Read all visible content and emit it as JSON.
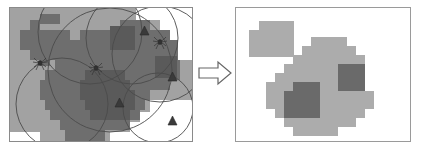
{
  "figure": {
    "title": "",
    "type": "raster-map-transformation-diagram",
    "width": 421,
    "height": 148,
    "background_color": "#ffffff"
  },
  "colors": {
    "panel_background_gray": "#a2a2a2",
    "raster_medium_gray": "#6e6e6e",
    "raster_dark_gray": "#5a5a5a",
    "raster_light_gray": "#a8a8a8",
    "raster_blob_gray": "#acacac",
    "raster_blob_dark_gray": "#6a6a6a",
    "white": "#ffffff",
    "outline_stroke": "#4b4b4b",
    "panel_border": "#8a8a8a",
    "arrow_stroke": "#666666"
  },
  "left_panel": {
    "label": "source-raster-with-overlays",
    "background": "#a2a2a2",
    "border": "#8a8a8a",
    "medium_patches": [
      {
        "x": 20,
        "y": 12,
        "w": 10,
        "h": 10
      },
      {
        "x": 30,
        "y": 6,
        "w": 20,
        "h": 10
      },
      {
        "x": 20,
        "y": 22,
        "w": 40,
        "h": 10
      },
      {
        "x": 10,
        "y": 22,
        "w": 10,
        "h": 20
      },
      {
        "x": 20,
        "y": 32,
        "w": 40,
        "h": 10
      },
      {
        "x": 20,
        "y": 42,
        "w": 30,
        "h": 10
      },
      {
        "x": 30,
        "y": 52,
        "w": 10,
        "h": 6
      },
      {
        "x": 70,
        "y": 22,
        "w": 50,
        "h": 10
      },
      {
        "x": 60,
        "y": 32,
        "w": 70,
        "h": 10
      },
      {
        "x": 50,
        "y": 42,
        "w": 90,
        "h": 10
      },
      {
        "x": 110,
        "y": 12,
        "w": 30,
        "h": 10
      },
      {
        "x": 120,
        "y": 22,
        "w": 40,
        "h": 10
      },
      {
        "x": 130,
        "y": 32,
        "w": 40,
        "h": 10
      },
      {
        "x": 140,
        "y": 42,
        "w": 30,
        "h": 10
      },
      {
        "x": 45,
        "y": 52,
        "w": 125,
        "h": 10
      },
      {
        "x": 35,
        "y": 62,
        "w": 135,
        "h": 10
      },
      {
        "x": 30,
        "y": 72,
        "w": 130,
        "h": 10
      },
      {
        "x": 30,
        "y": 82,
        "w": 110,
        "h": 10
      },
      {
        "x": 35,
        "y": 92,
        "w": 100,
        "h": 10
      },
      {
        "x": 40,
        "y": 102,
        "w": 90,
        "h": 10
      },
      {
        "x": 50,
        "y": 112,
        "w": 70,
        "h": 10
      },
      {
        "x": 55,
        "y": 122,
        "w": 40,
        "h": 11
      }
    ],
    "dark_patches": [
      {
        "x": 75,
        "y": 62,
        "w": 40,
        "h": 10
      },
      {
        "x": 70,
        "y": 72,
        "w": 50,
        "h": 10
      },
      {
        "x": 70,
        "y": 82,
        "w": 55,
        "h": 10
      },
      {
        "x": 75,
        "y": 92,
        "w": 50,
        "h": 10
      },
      {
        "x": 80,
        "y": 102,
        "w": 40,
        "h": 10
      },
      {
        "x": 100,
        "y": 18,
        "w": 25,
        "h": 24
      },
      {
        "x": 145,
        "y": 48,
        "w": 22,
        "h": 22
      }
    ],
    "white_patches": [
      {
        "x": 126,
        "y": 0,
        "w": 40,
        "h": 12
      },
      {
        "x": 150,
        "y": 0,
        "w": 34,
        "h": 22
      },
      {
        "x": 160,
        "y": 12,
        "w": 24,
        "h": 20
      },
      {
        "x": 168,
        "y": 22,
        "w": 16,
        "h": 30
      },
      {
        "x": 140,
        "y": 92,
        "w": 44,
        "h": 12
      },
      {
        "x": 130,
        "y": 104,
        "w": 54,
        "h": 10
      },
      {
        "x": 120,
        "y": 114,
        "w": 64,
        "h": 10
      },
      {
        "x": 100,
        "y": 124,
        "w": 84,
        "h": 11
      },
      {
        "x": 0,
        "y": 124,
        "w": 30,
        "h": 11
      }
    ],
    "circles": [
      {
        "cx": 100,
        "cy": 62,
        "r": 62,
        "label": "buffer-circle-large-center"
      },
      {
        "cx": 80,
        "cy": 24,
        "r": 52,
        "label": "buffer-circle-upper-left"
      },
      {
        "cx": 122,
        "cy": 30,
        "r": 46,
        "label": "buffer-circle-upper-right"
      },
      {
        "cx": 150,
        "cy": 46,
        "r": 48,
        "label": "buffer-circle-right"
      },
      {
        "cx": 148,
        "cy": 100,
        "r": 35,
        "label": "buffer-circle-lower-right"
      },
      {
        "cx": 52,
        "cy": 96,
        "r": 46,
        "label": "buffer-circle-lower-left"
      }
    ],
    "spider_markers": [
      {
        "x": 30,
        "y": 55,
        "label": "spider-symbol-left"
      },
      {
        "x": 86,
        "y": 60,
        "label": "spider-symbol-center"
      },
      {
        "x": 150,
        "y": 34,
        "label": "spider-symbol-right"
      }
    ],
    "triangle_markers": [
      {
        "x": 130,
        "y": 22,
        "label": "triangle-marker-top"
      },
      {
        "x": 158,
        "y": 68,
        "label": "triangle-marker-middle"
      },
      {
        "x": 105,
        "y": 94,
        "label": "triangle-marker-center"
      },
      {
        "x": 158,
        "y": 112,
        "label": "triangle-marker-bottom"
      }
    ]
  },
  "arrow": {
    "label": "transformation-arrow",
    "direction": "right",
    "style": "hollow-outline",
    "stroke": "#666666"
  },
  "right_panel": {
    "label": "result-raster-simplified",
    "background": "#ffffff",
    "border": "#9a9a9a",
    "light_blob_cells": [
      {
        "x": 23,
        "y": 13,
        "w": 35,
        "h": 9
      },
      {
        "x": 13,
        "y": 22,
        "w": 45,
        "h": 27
      },
      {
        "x": 75,
        "y": 29,
        "w": 36,
        "h": 9
      },
      {
        "x": 66,
        "y": 38,
        "w": 54,
        "h": 9
      },
      {
        "x": 57,
        "y": 47,
        "w": 72,
        "h": 9
      },
      {
        "x": 48,
        "y": 56,
        "w": 81,
        "h": 9
      },
      {
        "x": 39,
        "y": 65,
        "w": 90,
        "h": 9
      },
      {
        "x": 30,
        "y": 74,
        "w": 99,
        "h": 9
      },
      {
        "x": 30,
        "y": 83,
        "w": 108,
        "h": 9
      },
      {
        "x": 30,
        "y": 92,
        "w": 108,
        "h": 9
      },
      {
        "x": 39,
        "y": 101,
        "w": 90,
        "h": 9
      },
      {
        "x": 48,
        "y": 110,
        "w": 72,
        "h": 9
      },
      {
        "x": 57,
        "y": 119,
        "w": 45,
        "h": 9
      }
    ],
    "dark_blob_cells": [
      {
        "x": 57,
        "y": 74,
        "w": 27,
        "h": 9
      },
      {
        "x": 48,
        "y": 83,
        "w": 36,
        "h": 27
      },
      {
        "x": 102,
        "y": 56,
        "w": 27,
        "h": 27
      }
    ]
  }
}
